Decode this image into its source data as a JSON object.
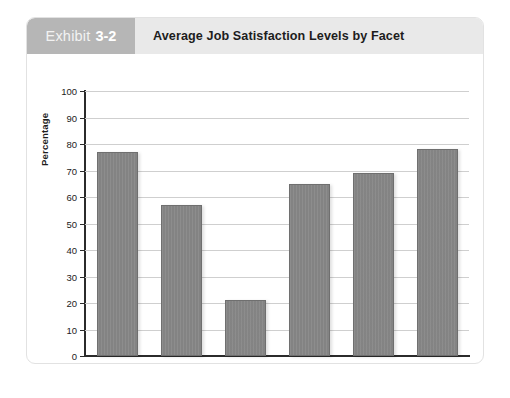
{
  "exhibit": {
    "badge_word": "Exhibit",
    "badge_number": "3-2",
    "title": "Average Job Satisfaction Levels by Facet"
  },
  "colors": {
    "badge_bg": "#b6b6b6",
    "header_bg": "#e9e9e9",
    "bar_fill": "#868686",
    "bar_border": "#6f6f6f",
    "grid": "#cfcfcf",
    "axis": "#2b2b2b",
    "card_border": "#e2e2e2",
    "page_bg": "#ffffff"
  },
  "chart_data": {
    "type": "bar",
    "title": "Average Job Satisfaction Levels by Facet",
    "xlabel": "",
    "ylabel": "Percentage",
    "categories": [
      "Work Itself",
      "Pay",
      "Promotion",
      "Supervision",
      "Coworkers",
      "Overall"
    ],
    "values": [
      77,
      57,
      21,
      65,
      69,
      78
    ],
    "ylim": [
      0,
      100
    ],
    "ytick_labels": [
      "100",
      "90",
      "80",
      "70",
      "60",
      "50",
      "40",
      "30",
      "20",
      "10",
      "0"
    ],
    "ytick_values": [
      100,
      90,
      80,
      70,
      60,
      50,
      40,
      30,
      20,
      10,
      0
    ],
    "grid": true,
    "grid_axis": "y",
    "legend": false,
    "legend_position": "none"
  }
}
